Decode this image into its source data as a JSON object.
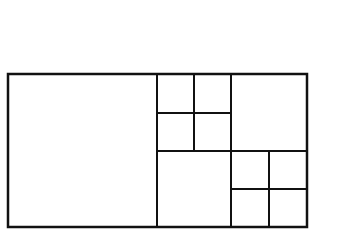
{
  "diagram": {
    "stroke_color": "#111111",
    "background": "#ffffff",
    "stroke_width": 2,
    "outer": {
      "x": 8,
      "y": 74,
      "w": 299,
      "h": 153
    },
    "regions": [
      {
        "name": "large-square-left",
        "x": 8,
        "y": 74,
        "w": 149,
        "h": 153
      },
      {
        "name": "small-square-top-left-1",
        "x": 157,
        "y": 74,
        "w": 37,
        "h": 39
      },
      {
        "name": "small-square-top-left-2",
        "x": 194,
        "y": 74,
        "w": 37,
        "h": 39
      },
      {
        "name": "small-square-top-left-3",
        "x": 157,
        "y": 113,
        "w": 37,
        "h": 38
      },
      {
        "name": "small-square-top-left-4",
        "x": 194,
        "y": 113,
        "w": 37,
        "h": 38
      },
      {
        "name": "medium-square-top-right",
        "x": 231,
        "y": 74,
        "w": 76,
        "h": 77
      },
      {
        "name": "medium-square-bottom-middle",
        "x": 157,
        "y": 151,
        "w": 74,
        "h": 76
      },
      {
        "name": "small-square-bottom-right-1",
        "x": 231,
        "y": 151,
        "w": 38,
        "h": 38
      },
      {
        "name": "small-square-bottom-right-2",
        "x": 269,
        "y": 151,
        "w": 38,
        "h": 38
      },
      {
        "name": "small-square-bottom-right-3",
        "x": 231,
        "y": 189,
        "w": 38,
        "h": 38
      },
      {
        "name": "small-square-bottom-right-4",
        "x": 269,
        "y": 189,
        "w": 38,
        "h": 38
      }
    ]
  }
}
